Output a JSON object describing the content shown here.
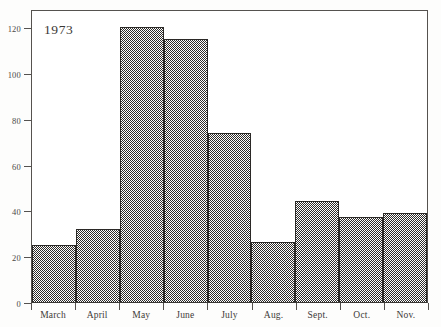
{
  "chart_data": {
    "type": "bar",
    "title": "1973",
    "xlabel": "",
    "ylabel": "",
    "categories": [
      "March",
      "April",
      "May",
      "June",
      "July",
      "Aug.",
      "Sept.",
      "Oct.",
      "Nov."
    ],
    "values": [
      25,
      32,
      120,
      115,
      74,
      26,
      44,
      37,
      39
    ],
    "ylim": [
      0,
      128
    ],
    "yticks": [
      0,
      20,
      40,
      60,
      80,
      100,
      120
    ],
    "ytick_labels": [
      "0",
      "20",
      "40",
      "60",
      "80",
      "100",
      "120"
    ],
    "grid": false,
    "legend": null,
    "fill_style": "50-percent-checkerboard-dither",
    "colors": {
      "bar_fill": "#777471",
      "bar_outline": "#2b2927",
      "axis": "#55524f",
      "text": "#3d3b38"
    }
  },
  "caption": {
    "year": "1973"
  }
}
